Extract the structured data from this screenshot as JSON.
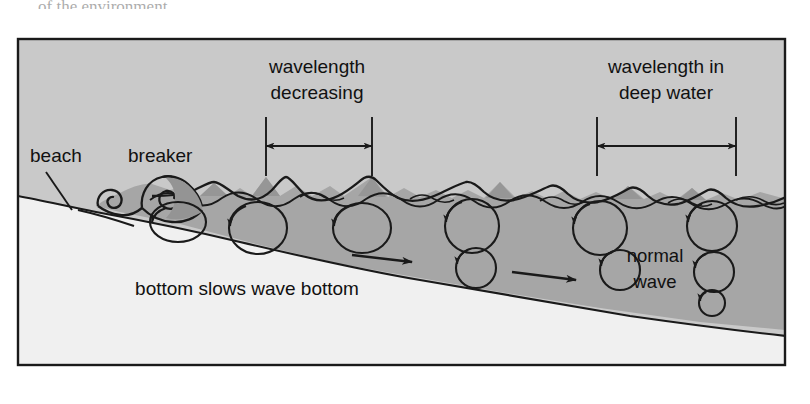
{
  "figure": {
    "top_cut_text": "of the environment",
    "frame": {
      "x": 17,
      "y": 38,
      "width": 769,
      "height": 328,
      "border_color": "#1a1a1a"
    },
    "colors": {
      "air": "#c9c9c9",
      "water": "#a8a8a8",
      "water_wave_crest": "#9a9a9a",
      "seafloor": "#f0f0f0",
      "ink": "#1a1a1a",
      "page_background": "#ffffff"
    },
    "labels": [
      {
        "id": "beach",
        "text": "beach",
        "x": 30,
        "y": 162
      },
      {
        "id": "breaker",
        "text": "breaker",
        "x": 128,
        "y": 162
      },
      {
        "id": "wavelength-decreasing-line1",
        "text": "wavelength",
        "x": 317,
        "y": 73
      },
      {
        "id": "wavelength-decreasing-line2",
        "text": "decreasing",
        "x": 317,
        "y": 99
      },
      {
        "id": "wavelength-deep-line1",
        "text": "wavelength in",
        "x": 666,
        "y": 73
      },
      {
        "id": "wavelength-deep-line2",
        "text": "deep water",
        "x": 666,
        "y": 99
      },
      {
        "id": "bottom-slows",
        "text": "bottom slows wave bottom",
        "x": 247,
        "y": 295
      },
      {
        "id": "normal-wave-line1",
        "text": "normal",
        "x": 655,
        "y": 262
      },
      {
        "id": "normal-wave-line2",
        "text": "wave",
        "x": 655,
        "y": 288
      }
    ],
    "dimensions": [
      {
        "id": "wavelength-decreasing",
        "label": "wavelength decreasing",
        "left_x": 266,
        "right_x": 372,
        "arrow_y": 146,
        "tick_top": 117,
        "tick_bottom": 175
      },
      {
        "id": "wavelength-deep-water",
        "label": "wavelength in deep water",
        "left_x": 597,
        "right_x": 736,
        "arrow_y": 146,
        "tick_top": 117,
        "tick_bottom": 175
      }
    ],
    "orbit_circles": {
      "surface_row_label": "surface orbital circles",
      "deep_row_label": "deep orbital circles",
      "decay_column_label": "orbital decay with depth"
    },
    "flow_arrows": {
      "count": 2,
      "direction": "right",
      "meaning": "wave bottom drag along seafloor"
    },
    "leader_lines": [
      {
        "id": "beach-leader",
        "from_x": 46,
        "from_y": 172,
        "to_x": 70,
        "to_y": 209
      }
    ]
  }
}
